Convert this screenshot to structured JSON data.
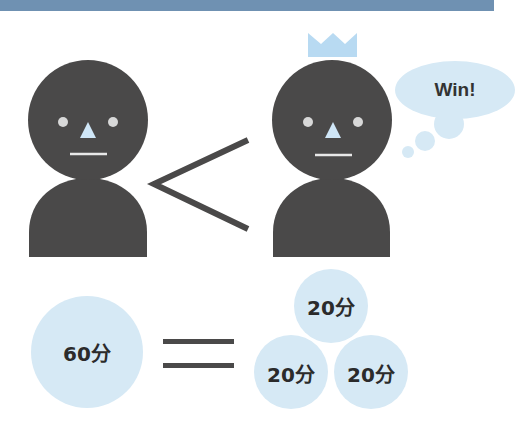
{
  "banner": {
    "color": "#6f91b2",
    "text_visible": false
  },
  "colors": {
    "figure": "#4a4949",
    "light_blue": "#d6e9f5",
    "crown": "#b8daf2",
    "nose": "#cfe6f7",
    "eye": "#d8d8d8",
    "symbol": "#4a4949"
  },
  "comparison": {
    "left_figure": {
      "crowned": false
    },
    "symbol": "<",
    "right_figure": {
      "crowned": true,
      "speech_bubble": "Win!"
    }
  },
  "equation": {
    "left": {
      "label": "60分"
    },
    "operator": "=",
    "right": [
      {
        "label": "20分"
      },
      {
        "label": "20分"
      },
      {
        "label": "20分"
      }
    ]
  }
}
